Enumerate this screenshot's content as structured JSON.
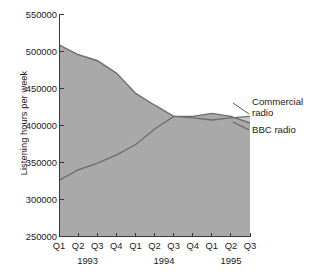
{
  "chart_data": {
    "type": "area",
    "title": "",
    "xlabel": "",
    "ylabel": "Listening hours per week",
    "ylim": [
      250000,
      550000
    ],
    "ytick_values": [
      250000,
      300000,
      350000,
      400000,
      450000,
      500000,
      550000
    ],
    "ytick_labels": [
      "250000",
      "300000",
      "350000",
      "400000",
      "450000",
      "500000",
      "550000"
    ],
    "grid": false,
    "stacked": false,
    "legend_position": "right-inline-callout",
    "x": [
      "Q1",
      "Q2",
      "Q3",
      "Q4",
      "Q1",
      "Q2",
      "Q3",
      "Q4",
      "Q1",
      "Q2",
      "Q3"
    ],
    "x_groups": [
      {
        "label": "1993",
        "quarters": [
          "Q1",
          "Q2",
          "Q3",
          "Q4"
        ]
      },
      {
        "label": "1994",
        "quarters": [
          "Q1",
          "Q2",
          "Q3",
          "Q4"
        ]
      },
      {
        "label": "1995",
        "quarters": [
          "Q1",
          "Q2",
          "Q3"
        ]
      }
    ],
    "series": [
      {
        "name": "Commercial radio",
        "color": "#a9a9a9",
        "line_color": "#6e6e6e",
        "values": [
          508000,
          495000,
          487000,
          470000,
          443000,
          427000,
          412000,
          412000,
          416000,
          412000,
          403000
        ]
      },
      {
        "name": "BBC radio",
        "color": "#cbcbcb",
        "line_color": "#6e6e6e",
        "values": [
          326000,
          340000,
          349000,
          360000,
          374000,
          395000,
          412000,
          410000,
          407000,
          410000,
          412000
        ]
      }
    ]
  },
  "axes": {
    "ylabel": "Listening hours per week",
    "ytick_labels": [
      "550000",
      "500000",
      "450000",
      "400000",
      "350000",
      "300000",
      "250000"
    ],
    "xtick_quarters": [
      "Q1",
      "Q2",
      "Q3",
      "Q4",
      "Q1",
      "Q2",
      "Q3",
      "Q4",
      "Q1",
      "Q2",
      "Q3"
    ],
    "xtick_years": [
      "1993",
      "1994",
      "1995"
    ]
  },
  "legend": {
    "commercial": {
      "line1": "Commercial",
      "line2": "radio"
    },
    "bbc": {
      "line1": "BBC radio"
    }
  }
}
